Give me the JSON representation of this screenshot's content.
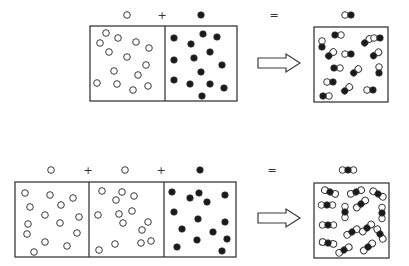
{
  "colors": {
    "stroke": "#3a3a3a",
    "fill_dark": "#1a1a1a",
    "fill_light": "#ffffff",
    "background": "#ffffff"
  },
  "reactions": [
    {
      "id": "top",
      "labels": [
        {
          "type": "open",
          "x": 127,
          "y": 15
        },
        {
          "type": "text",
          "text": "+",
          "x": 162,
          "y": 19
        },
        {
          "type": "filled",
          "x": 201,
          "y": 15
        },
        {
          "type": "text",
          "text": "=",
          "x": 274,
          "y": 19
        },
        {
          "type": "pair",
          "x": 348,
          "y": 15
        }
      ],
      "reactant_box": {
        "x": 90,
        "y": 26,
        "w": 147,
        "h": 75,
        "dividers": [
          165
        ]
      },
      "open_particles": [
        [
          106,
          33
        ],
        [
          100,
          43
        ],
        [
          118,
          38
        ],
        [
          136,
          42
        ],
        [
          109,
          52
        ],
        [
          127,
          57
        ],
        [
          149,
          48
        ],
        [
          146,
          65
        ],
        [
          114,
          71
        ],
        [
          138,
          75
        ],
        [
          97,
          83
        ],
        [
          117,
          84
        ],
        [
          133,
          90
        ],
        [
          148,
          86
        ]
      ],
      "filled_particles": [
        [
          174,
          38
        ],
        [
          191,
          44
        ],
        [
          203,
          34
        ],
        [
          217,
          37
        ],
        [
          174,
          60
        ],
        [
          194,
          58
        ],
        [
          210,
          52
        ],
        [
          222,
          65
        ],
        [
          201,
          72
        ],
        [
          174,
          80
        ],
        [
          190,
          84
        ],
        [
          210,
          84
        ],
        [
          224,
          88
        ],
        [
          202,
          96
        ]
      ],
      "arrow": {
        "x": 258,
        "y": 63,
        "w": 42
      },
      "product_box": {
        "x": 314,
        "y": 27,
        "w": 74,
        "h": 75
      },
      "molecules": [
        {
          "type": "pair",
          "cx": 322,
          "cy": 44,
          "vertical": true,
          "order": "lo"
        },
        {
          "type": "pair",
          "cx": 338,
          "cy": 35,
          "vertical": false,
          "order": "dl"
        },
        {
          "type": "pair",
          "cx": 367,
          "cy": 41,
          "vertical": false,
          "order": "dl",
          "rot": -40
        },
        {
          "type": "pair",
          "cx": 377,
          "cy": 38,
          "vertical": false,
          "order": "ld"
        },
        {
          "type": "pair",
          "cx": 331,
          "cy": 54,
          "vertical": false,
          "order": "dl",
          "rot": -40
        },
        {
          "type": "pair",
          "cx": 348,
          "cy": 54,
          "vertical": false,
          "order": "ld"
        },
        {
          "type": "pair",
          "cx": 376,
          "cy": 54,
          "vertical": false,
          "order": "dl",
          "rot": -35
        },
        {
          "type": "pair",
          "cx": 337,
          "cy": 68,
          "vertical": false,
          "order": "dl"
        },
        {
          "type": "pair",
          "cx": 356,
          "cy": 71,
          "vertical": false,
          "order": "dl",
          "rot": -40
        },
        {
          "type": "pair",
          "cx": 379,
          "cy": 70,
          "vertical": true,
          "order": "lo"
        },
        {
          "type": "pair",
          "cx": 330,
          "cy": 82,
          "vertical": false,
          "order": "ld"
        },
        {
          "type": "pair",
          "cx": 347,
          "cy": 89,
          "vertical": false,
          "order": "dl",
          "rot": -40
        },
        {
          "type": "pair",
          "cx": 370,
          "cy": 90,
          "vertical": false,
          "order": "ld"
        },
        {
          "type": "pair",
          "cx": 326,
          "cy": 96,
          "vertical": false,
          "order": "dl"
        }
      ]
    },
    {
      "id": "bottom",
      "labels": [
        {
          "type": "open",
          "x": 51,
          "y": 170
        },
        {
          "type": "text",
          "text": "+",
          "x": 88,
          "y": 174
        },
        {
          "type": "open",
          "x": 125,
          "y": 170
        },
        {
          "type": "text",
          "text": "+",
          "x": 161,
          "y": 174
        },
        {
          "type": "filled",
          "x": 200,
          "y": 170
        },
        {
          "type": "text",
          "text": "=",
          "x": 272,
          "y": 174
        },
        {
          "type": "triple",
          "x": 348,
          "y": 170
        }
      ],
      "reactant_box": {
        "x": 15,
        "y": 182,
        "w": 221,
        "h": 75,
        "dividers": [
          89,
          164
        ]
      },
      "open_particles": [
        [
          25,
          193
        ],
        [
          50,
          195
        ],
        [
          73,
          198
        ],
        [
          30,
          207
        ],
        [
          61,
          205
        ],
        [
          45,
          215
        ],
        [
          79,
          217
        ],
        [
          28,
          224
        ],
        [
          60,
          223
        ],
        [
          27,
          234
        ],
        [
          45,
          242
        ],
        [
          77,
          233
        ],
        [
          67,
          246
        ],
        [
          34,
          252
        ],
        [
          102,
          191
        ],
        [
          122,
          192
        ],
        [
          134,
          196
        ],
        [
          116,
          200
        ],
        [
          98,
          215
        ],
        [
          119,
          214
        ],
        [
          132,
          211
        ],
        [
          123,
          223
        ],
        [
          148,
          222
        ],
        [
          142,
          230
        ],
        [
          141,
          243
        ],
        [
          115,
          244
        ],
        [
          99,
          250
        ],
        [
          151,
          241
        ]
      ],
      "filled_particles": [
        [
          172,
          192
        ],
        [
          190,
          198
        ],
        [
          199,
          193
        ],
        [
          207,
          202
        ],
        [
          225,
          195
        ],
        [
          174,
          212
        ],
        [
          198,
          219
        ],
        [
          225,
          222
        ],
        [
          182,
          229
        ],
        [
          213,
          232
        ],
        [
          197,
          240
        ],
        [
          227,
          239
        ],
        [
          177,
          247
        ],
        [
          222,
          251
        ]
      ],
      "arrow": {
        "x": 258,
        "y": 218,
        "w": 42
      },
      "product_box": {
        "x": 314,
        "y": 183,
        "w": 75,
        "h": 75
      },
      "molecules": [
        {
          "type": "triple",
          "cx": 330,
          "cy": 192,
          "rot": 20
        },
        {
          "type": "triple",
          "cx": 356,
          "cy": 192,
          "rot": -20
        },
        {
          "type": "triple",
          "cx": 378,
          "cy": 194,
          "rot": 30
        },
        {
          "type": "triple",
          "cx": 327,
          "cy": 205,
          "rot": 0
        },
        {
          "type": "triple",
          "cx": 361,
          "cy": 204,
          "rot": -40
        },
        {
          "type": "triple",
          "cx": 345,
          "cy": 212,
          "rot": 90
        },
        {
          "type": "triple",
          "cx": 382,
          "cy": 213,
          "rot": 90
        },
        {
          "type": "triple",
          "cx": 328,
          "cy": 225,
          "rot": 0
        },
        {
          "type": "triple",
          "cx": 352,
          "cy": 232,
          "rot": -30
        },
        {
          "type": "triple",
          "cx": 367,
          "cy": 228,
          "rot": -40
        },
        {
          "type": "triple",
          "cx": 380,
          "cy": 234,
          "rot": 60
        },
        {
          "type": "triple",
          "cx": 328,
          "cy": 243,
          "rot": 10
        },
        {
          "type": "triple",
          "cx": 344,
          "cy": 250,
          "rot": -30
        },
        {
          "type": "triple",
          "cx": 368,
          "cy": 247,
          "rot": -40
        }
      ]
    }
  ]
}
